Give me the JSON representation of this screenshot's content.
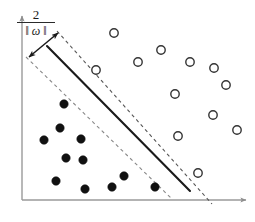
{
  "figure": {
    "background_color": "#ffffff"
  },
  "annotation": {
    "margin_numerator": "2",
    "margin_denominator": "‖ ω ‖",
    "margin_expression": "2 / ‖ω‖",
    "arrow_name": "margin-width-double-arrow"
  },
  "axes": {
    "color": "#9a9a9a",
    "y_axis": {
      "x": 22,
      "y_top": 14,
      "y_bottom": 200
    },
    "x_axis": {
      "y": 200,
      "x_left": 22,
      "x_right": 248
    },
    "arrowheads": true,
    "tick_labels": [],
    "xlabel": "",
    "ylabel": ""
  },
  "chart_data": {
    "type": "scatter",
    "title": "",
    "subtitle": "",
    "xlabel": "",
    "ylabel": "",
    "xlim": [
      0,
      255
    ],
    "ylim": [
      0,
      222
    ],
    "grid": false,
    "legend": [],
    "legend_position": "none",
    "annotations": [
      {
        "text": "2 / ‖ω‖",
        "meaning": "margin width between the two dashed support hyperplanes",
        "x": 36,
        "y": 24
      }
    ],
    "lines": [
      {
        "name": "upper-margin-line",
        "style": "dashed",
        "color": "#555555",
        "x1": 57,
        "y1": 31,
        "x2": 212,
        "y2": 204,
        "label": "w·x + b = +1"
      },
      {
        "name": "decision-boundary",
        "style": "solid",
        "color": "#1a1a1a",
        "x1": 47,
        "y1": 46,
        "x2": 190,
        "y2": 191,
        "label": "w·x + b = 0"
      },
      {
        "name": "lower-margin-line",
        "style": "dashed",
        "color": "#888888",
        "x1": 26,
        "y1": 57,
        "x2": 172,
        "y2": 199,
        "label": "w·x + b = -1"
      }
    ],
    "margin_arrow": {
      "x1": 29,
      "y1": 57,
      "x2": 58,
      "y2": 33,
      "double_headed": true,
      "color": "#1a1a1a"
    },
    "series": [
      {
        "name": "class-negative-filled",
        "marker": "filled-circle",
        "color": "#111111",
        "radius": 4.2,
        "points": [
          {
            "x": 64,
            "y": 104,
            "support_vector": false
          },
          {
            "x": 60,
            "y": 128,
            "support_vector": false
          },
          {
            "x": 44,
            "y": 140,
            "support_vector": false
          },
          {
            "x": 81,
            "y": 139,
            "support_vector": false
          },
          {
            "x": 66,
            "y": 158,
            "support_vector": false
          },
          {
            "x": 83,
            "y": 160,
            "support_vector": false
          },
          {
            "x": 56,
            "y": 181,
            "support_vector": false
          },
          {
            "x": 85,
            "y": 189,
            "support_vector": false
          },
          {
            "x": 112,
            "y": 187,
            "support_vector": false
          },
          {
            "x": 124,
            "y": 176,
            "support_vector": false
          },
          {
            "x": 155,
            "y": 187,
            "support_vector": true
          }
        ]
      },
      {
        "name": "class-positive-hollow",
        "marker": "hollow-circle",
        "color": "#333333",
        "radius": 4.2,
        "points": [
          {
            "x": 114,
            "y": 33,
            "support_vector": false
          },
          {
            "x": 161,
            "y": 50,
            "support_vector": false
          },
          {
            "x": 138,
            "y": 62,
            "support_vector": false
          },
          {
            "x": 190,
            "y": 62,
            "support_vector": false
          },
          {
            "x": 214,
            "y": 68,
            "support_vector": false
          },
          {
            "x": 226,
            "y": 85,
            "support_vector": false
          },
          {
            "x": 175,
            "y": 94,
            "support_vector": false
          },
          {
            "x": 213,
            "y": 115,
            "support_vector": false
          },
          {
            "x": 237,
            "y": 130,
            "support_vector": false
          },
          {
            "x": 96,
            "y": 70,
            "support_vector": true
          },
          {
            "x": 178,
            "y": 136,
            "support_vector": true
          },
          {
            "x": 198,
            "y": 173,
            "support_vector": true
          }
        ]
      }
    ]
  }
}
